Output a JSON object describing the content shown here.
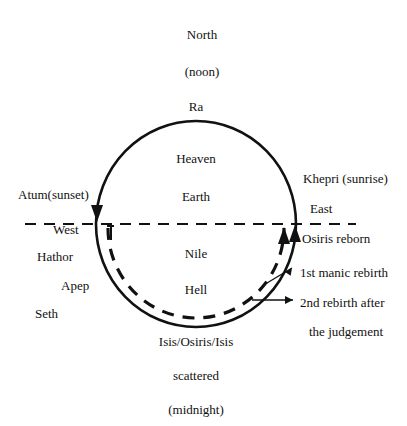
{
  "diagram": {
    "colors": {
      "ink": "#111111",
      "background": "#ffffff"
    },
    "top_labels": [
      {
        "text": "North",
        "x": 202,
        "y": 34
      },
      {
        "text": "(noon)",
        "x": 202,
        "y": 71
      },
      {
        "text": "Ra",
        "x": 196,
        "y": 106
      }
    ],
    "inner_labels": [
      {
        "text": "Heaven",
        "x": 196,
        "y": 158
      },
      {
        "text": "Earth",
        "x": 196,
        "y": 196
      },
      {
        "text": "Nile",
        "x": 196,
        "y": 253
      },
      {
        "text": "Hell",
        "x": 196,
        "y": 289
      }
    ],
    "bottom_labels": [
      {
        "text": "Isis/Osiris/Isis",
        "x": 196,
        "y": 341
      },
      {
        "text": "scattered",
        "x": 196,
        "y": 375
      },
      {
        "text": "(midnight)",
        "x": 196,
        "y": 409
      }
    ],
    "left_labels": [
      {
        "text": "Atum(sunset)",
        "x": 18,
        "y": 194,
        "align": "left"
      },
      {
        "text": "West",
        "x": 53,
        "y": 229,
        "align": "left"
      },
      {
        "text": "Hathor",
        "x": 37,
        "y": 256,
        "align": "left"
      },
      {
        "text": "Apep",
        "x": 61,
        "y": 285,
        "align": "left"
      },
      {
        "text": "Seth",
        "x": 35,
        "y": 313,
        "align": "left"
      }
    ],
    "right_labels": [
      {
        "text": "Khepri (sunrise)",
        "x": 303,
        "y": 178,
        "align": "left"
      },
      {
        "text": "East",
        "x": 310,
        "y": 208,
        "align": "left"
      },
      {
        "text": "Osiris reborn",
        "x": 302,
        "y": 238,
        "align": "left"
      },
      {
        "text": "1st manic rebirth",
        "x": 300,
        "y": 272,
        "align": "left"
      },
      {
        "text": "2nd rebirth after",
        "x": 300,
        "y": 302,
        "align": "left"
      },
      {
        "text": "the judgement",
        "x": 309,
        "y": 331,
        "align": "left"
      }
    ],
    "geometry": {
      "circle_center_x": 196,
      "circle_center_y": 224,
      "circle_radius_x": 100,
      "circle_radius_y": 103,
      "horizon_y": 224,
      "horizon_x_start": 25,
      "horizon_x_end": 356
    }
  }
}
